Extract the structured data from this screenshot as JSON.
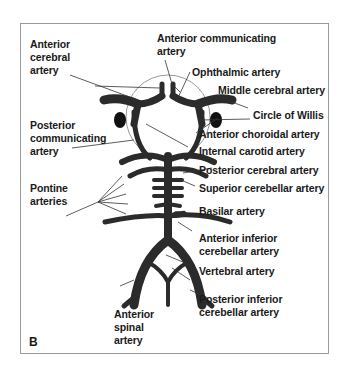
{
  "figure": {
    "panel_label": "B",
    "colors": {
      "vessel": "#2b2b2b",
      "leader": "#333333",
      "circle": "#999999",
      "frame": "#9a9a9a"
    }
  },
  "labels": {
    "anterior_cerebral": [
      "Anterior",
      "cerebral",
      "artery"
    ],
    "anterior_communicating": [
      "Anterior communicating",
      "artery"
    ],
    "ophthalmic": "Ophthalmic artery",
    "middle_cerebral": "Middle cerebral artery",
    "circle_of_willis": "Circle of Willis",
    "posterior_communicating": [
      "Posterior",
      "communicating",
      "artery"
    ],
    "anterior_choroidal": "Anterior choroidal artery",
    "internal_carotid": "Internal carotid artery",
    "posterior_cerebral": "Posterior cerebral artery",
    "pontine": [
      "Pontine",
      "arteries"
    ],
    "superior_cerebellar": "Superior cerebellar artery",
    "basilar": "Basilar artery",
    "anterior_inferior_cerebellar": [
      "Anterior inferior",
      "cerebellar artery"
    ],
    "vertebral": "Vertebral artery",
    "anterior_spinal": [
      "Anterior",
      "spinal",
      "artery"
    ],
    "posterior_inferior_cerebellar": [
      "Posterior inferior",
      "cerebellar artery"
    ]
  }
}
